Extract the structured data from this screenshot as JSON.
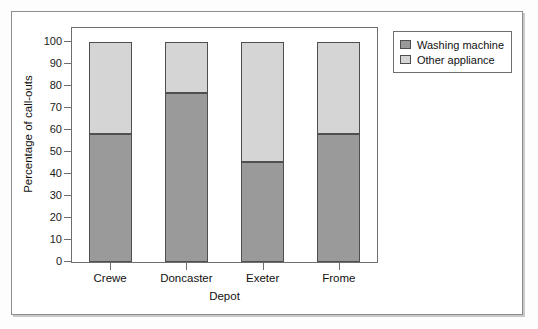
{
  "chart_data": {
    "type": "bar",
    "subtype": "stacked-percentage-column",
    "title": "",
    "xlabel": "Depot",
    "ylabel": "Percentage of call-outs",
    "categories": [
      "Crewe",
      "Doncaster",
      "Exeter",
      "Frome"
    ],
    "series": [
      {
        "name": "Washing machine",
        "color": "#9a9a9a",
        "values": [
          58,
          77,
          45.5,
          58
        ]
      },
      {
        "name": "Other appliance",
        "color": "#d5d5d5",
        "values": [
          42,
          23,
          54.5,
          42
        ]
      }
    ],
    "ylim": [
      0,
      100
    ],
    "ytick_values": [
      100,
      90,
      80,
      70,
      60,
      50,
      40,
      30,
      20,
      10,
      0
    ],
    "ytick_labels": [
      "100",
      "90",
      "80",
      "70",
      "60",
      "50",
      "40",
      "30",
      "20",
      "10",
      "0"
    ],
    "grid": false,
    "legend_position": "outside-top-right",
    "legend_entries": [
      "Washing machine",
      "Other appliance"
    ],
    "stack_total": 100
  },
  "legend": {
    "items": [
      {
        "label": "Washing machine",
        "swatch": "#9a9a9a"
      },
      {
        "label": "Other appliance",
        "swatch": "#d5d5d5"
      }
    ]
  },
  "axes": {
    "y_title": "Percentage of call-outs",
    "x_title": "Depot"
  }
}
